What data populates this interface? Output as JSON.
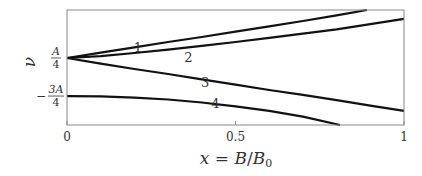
{
  "chart_data": {
    "type": "line",
    "title": "",
    "xlabel": "x = B/B0",
    "ylabel": "ν",
    "xlim": [
      0,
      1
    ],
    "ylim_in_units_of_A": [
      -1.51,
      1.51
    ],
    "grid": false,
    "legend": "inline curve labels",
    "x_ticks": [
      {
        "value": 0,
        "label": "0"
      },
      {
        "value": 0.5,
        "label": "0.5"
      },
      {
        "value": 1,
        "label": "1"
      }
    ],
    "y_ticks": [
      {
        "value": 0.25,
        "label": "A/4",
        "numerator": "A",
        "denominator": "4",
        "sign": ""
      },
      {
        "value": -0.75,
        "label": "-3A/4",
        "numerator": "3A",
        "denominator": "4",
        "sign": "−"
      }
    ],
    "series": [
      {
        "name": "1",
        "label_pos": {
          "x": 0.21,
          "y": 0.5
        },
        "x": [
          0,
          0.1,
          0.2,
          0.3,
          0.4,
          0.5,
          0.6,
          0.7,
          0.8,
          0.89
        ],
        "y": [
          0.25,
          0.39,
          0.53,
          0.67,
          0.8,
          0.94,
          1.08,
          1.22,
          1.37,
          1.51
        ]
      },
      {
        "name": "2",
        "label_pos": {
          "x": 0.36,
          "y": 0.26
        },
        "x": [
          0,
          0.1,
          0.2,
          0.3,
          0.4,
          0.5,
          0.6,
          0.7,
          0.8,
          0.9,
          1.0
        ],
        "y": [
          0.25,
          0.3,
          0.38,
          0.47,
          0.57,
          0.67,
          0.78,
          0.89,
          1.0,
          1.14,
          1.28
        ]
      },
      {
        "name": "3",
        "label_pos": {
          "x": 0.41,
          "y": -0.4
        },
        "x": [
          0,
          0.1,
          0.2,
          0.3,
          0.4,
          0.5,
          0.6,
          0.7,
          0.8,
          0.9,
          1.0
        ],
        "y": [
          0.25,
          0.1,
          -0.04,
          -0.17,
          -0.31,
          -0.45,
          -0.59,
          -0.72,
          -0.86,
          -1.0,
          -1.14
        ]
      },
      {
        "name": "4",
        "label_pos": {
          "x": 0.44,
          "y": -0.95
        },
        "x": [
          0,
          0.1,
          0.2,
          0.3,
          0.4,
          0.5,
          0.6,
          0.7,
          0.81
        ],
        "y": [
          -0.75,
          -0.76,
          -0.79,
          -0.84,
          -0.92,
          -1.02,
          -1.14,
          -1.29,
          -1.51
        ]
      }
    ]
  },
  "axes": {
    "xlabel_parts": {
      "x": "x",
      "eq": " = ",
      "B": "B",
      "slash": "/",
      "B0": "B",
      "sub": "0"
    },
    "ylabel": "ν"
  }
}
